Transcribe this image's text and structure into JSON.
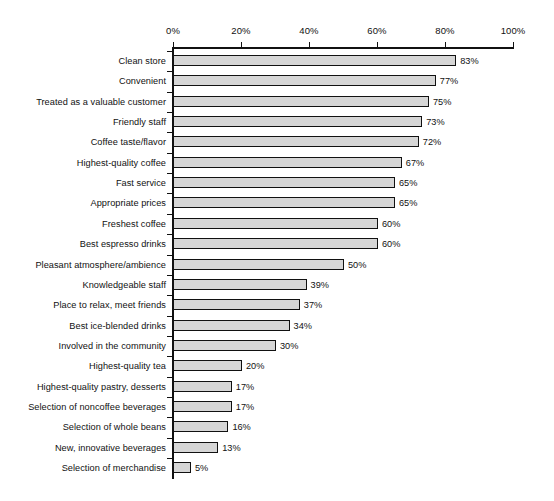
{
  "chart_data": {
    "type": "bar",
    "orientation": "horizontal",
    "title": "",
    "subtitle": "",
    "xlabel": "",
    "ylabel": "",
    "xlim": [
      0,
      100
    ],
    "grid": false,
    "legend": null,
    "value_suffix": "%",
    "axis": {
      "position": "top",
      "ticks": [
        0,
        20,
        40,
        60,
        80,
        100
      ],
      "tick_labels": [
        "0%",
        "20%",
        "40%",
        "60%",
        "80%",
        "100%"
      ]
    },
    "categories": [
      "Clean store",
      "Convenient",
      "Treated as a valuable customer",
      "Friendly staff",
      "Coffee taste/flavor",
      "Highest-quality coffee",
      "Fast service",
      "Appropriate prices",
      "Freshest coffee",
      "Best espresso drinks",
      "Pleasant atmosphere/ambience",
      "Knowledgeable staff",
      "Place to relax, meet friends",
      "Best ice-blended drinks",
      "Involved in the community",
      "Highest-quality tea",
      "Highest-quality pastry, desserts",
      "Selection of noncoffee beverages",
      "Selection of whole beans",
      "New, innovative beverages",
      "Selection of merchandise"
    ],
    "values": [
      83,
      77,
      75,
      73,
      72,
      67,
      65,
      65,
      60,
      60,
      50,
      39,
      37,
      34,
      30,
      20,
      17,
      17,
      16,
      13,
      5
    ],
    "value_labels": [
      "83%",
      "77%",
      "75%",
      "73%",
      "72%",
      "67%",
      "65%",
      "65%",
      "60%",
      "60%",
      "50%",
      "39%",
      "37%",
      "34%",
      "30%",
      "20%",
      "17%",
      "17%",
      "16%",
      "13%",
      "5%"
    ],
    "colors": {
      "bar_fill": "#d6d6d6",
      "bar_border": "#111111",
      "axis": "#111111",
      "text": "#111111",
      "background": "#ffffff"
    }
  }
}
